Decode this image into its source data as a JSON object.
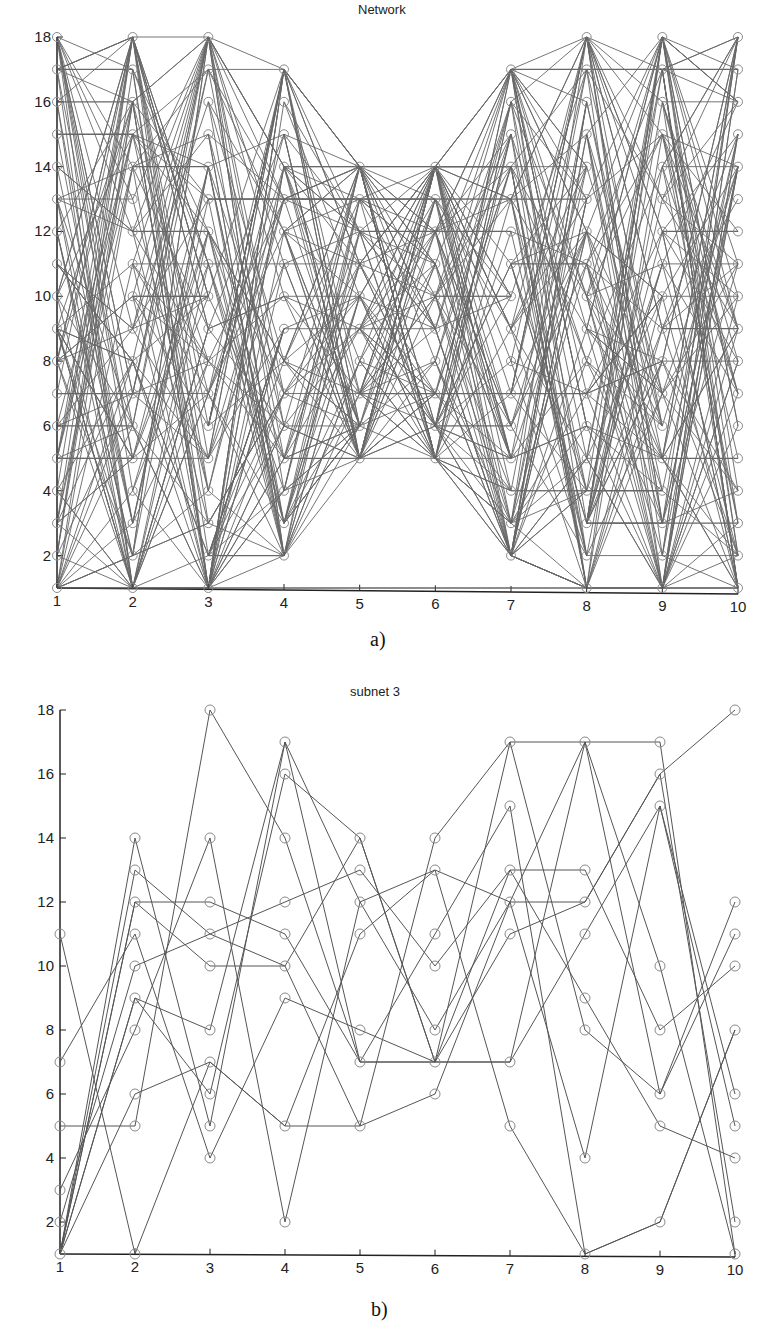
{
  "chart_data": [
    {
      "id": "a",
      "type": "line",
      "title": "Network",
      "caption": "a)",
      "xlabel": "",
      "ylabel": "",
      "x_ticks": [
        "1",
        "2",
        "3",
        "4",
        "5",
        "6",
        "7",
        "8",
        "9",
        "10"
      ],
      "y_ticks": [
        "2",
        "4",
        "6",
        "8",
        "10",
        "12",
        "14",
        "16",
        "18"
      ],
      "xlim": [
        1,
        10
      ],
      "ylim": [
        1,
        18
      ],
      "grid": false,
      "marker": "circle",
      "description": "Dense layered network: each column (stage 1-10) has nodes at integer levels; edges connect nodes in adjacent stages plus some horizontal edges spanning stages.",
      "column_node_ranges": [
        {
          "x": 1,
          "min": 1,
          "max": 18
        },
        {
          "x": 2,
          "min": 1,
          "max": 18
        },
        {
          "x": 3,
          "min": 1,
          "max": 18
        },
        {
          "x": 4,
          "min": 2,
          "max": 17
        },
        {
          "x": 5,
          "min": 5,
          "max": 14
        },
        {
          "x": 6,
          "min": 5,
          "max": 14
        },
        {
          "x": 7,
          "min": 2,
          "max": 17
        },
        {
          "x": 8,
          "min": 1,
          "max": 18
        },
        {
          "x": 9,
          "min": 1,
          "max": 18
        },
        {
          "x": 10,
          "min": 1,
          "max": 18
        }
      ],
      "horizontal_edges": [
        {
          "y": 17,
          "x": [
            1,
            2
          ]
        },
        {
          "y": 16,
          "x": [
            1,
            2
          ]
        },
        {
          "y": 15,
          "x": [
            1,
            2
          ]
        },
        {
          "y": 7,
          "x": [
            1,
            2
          ]
        },
        {
          "y": 6,
          "x": [
            1,
            2
          ]
        },
        {
          "y": 5,
          "x": [
            1,
            2
          ]
        },
        {
          "y": 14,
          "x": [
            2,
            3
          ]
        },
        {
          "y": 12,
          "x": [
            2,
            3
          ]
        },
        {
          "y": 10,
          "x": [
            2,
            3
          ]
        },
        {
          "y": 13,
          "x": [
            3,
            5
          ]
        },
        {
          "y": 2,
          "x": [
            3,
            4
          ]
        },
        {
          "y": 14,
          "x": [
            4,
            7
          ]
        },
        {
          "y": 13,
          "x": [
            4,
            6
          ]
        },
        {
          "y": 12,
          "x": [
            5,
            7
          ]
        },
        {
          "y": 5,
          "x": [
            4,
            5
          ]
        },
        {
          "y": 7,
          "x": [
            5,
            8
          ]
        },
        {
          "y": 6,
          "x": [
            6,
            7
          ]
        },
        {
          "y": 17,
          "x": [
            7,
            10
          ]
        },
        {
          "y": 13,
          "x": [
            7,
            8
          ]
        },
        {
          "y": 11,
          "x": [
            7,
            8
          ]
        },
        {
          "y": 4,
          "x": [
            8,
            9
          ]
        },
        {
          "y": 3,
          "x": [
            8,
            10
          ]
        },
        {
          "y": 5,
          "x": [
            9,
            10
          ]
        },
        {
          "y": 12,
          "x": [
            9,
            10
          ]
        },
        {
          "y": 9,
          "x": [
            9,
            10
          ]
        },
        {
          "y": 1,
          "x": [
            1,
            10
          ]
        }
      ],
      "random_edges_per_gap": 70,
      "seed": 7
    },
    {
      "id": "b",
      "type": "line",
      "title": "subnet 3",
      "caption": "b)",
      "xlabel": "",
      "ylabel": "",
      "x_ticks": [
        "1",
        "2",
        "3",
        "4",
        "5",
        "6",
        "7",
        "8",
        "9",
        "10"
      ],
      "y_ticks": [
        "2",
        "4",
        "6",
        "8",
        "10",
        "12",
        "14",
        "16",
        "18"
      ],
      "xlim": [
        1,
        10
      ],
      "ylim": [
        1,
        18
      ],
      "grid": false,
      "marker": "circle",
      "series": [
        {
          "name": "path-1",
          "x": [
            1,
            2,
            3,
            4,
            5,
            6,
            7,
            8,
            9,
            10
          ],
          "y": [
            11,
            1,
            7,
            5,
            5,
            6,
            12,
            12,
            16,
            18
          ]
        },
        {
          "name": "path-2",
          "x": [
            1,
            2,
            3,
            4,
            5,
            6,
            7,
            8,
            9,
            10
          ],
          "y": [
            1,
            14,
            5,
            17,
            7,
            7,
            7,
            17,
            17,
            1
          ]
        },
        {
          "name": "path-3",
          "x": [
            1,
            2,
            3,
            4,
            5,
            6,
            7,
            8,
            9,
            10
          ],
          "y": [
            1,
            13,
            11,
            10,
            5,
            14,
            17,
            17,
            6,
            11
          ]
        },
        {
          "name": "path-4",
          "x": [
            1,
            2,
            3,
            4,
            5,
            6,
            7,
            8,
            9,
            10
          ],
          "y": [
            1,
            12,
            12,
            11,
            7,
            11,
            15,
            1,
            2,
            8
          ]
        },
        {
          "name": "path-5",
          "x": [
            1,
            2,
            3,
            4,
            5,
            6,
            7,
            8,
            9,
            10
          ],
          "y": [
            2,
            10,
            11,
            12,
            13,
            10,
            13,
            13,
            8,
            10
          ]
        },
        {
          "name": "path-6",
          "x": [
            1,
            2,
            3,
            4,
            5,
            6,
            7,
            8,
            9,
            10
          ],
          "y": [
            1,
            9,
            6,
            16,
            14,
            7,
            13,
            9,
            5,
            4
          ]
        },
        {
          "name": "path-7",
          "x": [
            1,
            2,
            3,
            4,
            5,
            6,
            7,
            8,
            9,
            10
          ],
          "y": [
            3,
            8,
            14,
            2,
            12,
            13,
            5,
            1,
            2,
            8
          ]
        },
        {
          "name": "path-8",
          "x": [
            1,
            2,
            3,
            4,
            5,
            6,
            7,
            8,
            9,
            10
          ],
          "y": [
            5,
            5,
            18,
            14,
            7,
            7,
            17,
            8,
            6,
            12
          ]
        },
        {
          "name": "path-9",
          "x": [
            1,
            2,
            3,
            4,
            5,
            6,
            7,
            8,
            9,
            10
          ],
          "y": [
            7,
            11,
            4,
            9,
            8,
            7,
            11,
            12,
            16,
            2
          ]
        },
        {
          "name": "path-10",
          "x": [
            1,
            2,
            3,
            4,
            5,
            6,
            7,
            8,
            9,
            10
          ],
          "y": [
            1,
            6,
            7,
            5,
            11,
            13,
            12,
            4,
            15,
            5
          ]
        },
        {
          "name": "path-11",
          "x": [
            1,
            2,
            3,
            4,
            5,
            6,
            7,
            8,
            9,
            10
          ],
          "y": [
            1,
            12,
            10,
            10,
            14,
            7,
            7,
            11,
            15,
            6
          ]
        },
        {
          "name": "path-12",
          "x": [
            1,
            2,
            3,
            4,
            5,
            6,
            7,
            8,
            9,
            10
          ],
          "y": [
            1,
            9,
            8,
            17,
            12,
            8,
            12,
            17,
            10,
            1
          ]
        }
      ]
    }
  ],
  "panels": {
    "a": {
      "title": "Network",
      "caption": "a)"
    },
    "b": {
      "title": "subnet 3",
      "caption": "b)"
    }
  },
  "colors": {
    "line": "#555555",
    "dense_line": "#4d4d4d",
    "marker": "#8a8a8a",
    "axis": "#222222",
    "background": "#ffffff"
  }
}
